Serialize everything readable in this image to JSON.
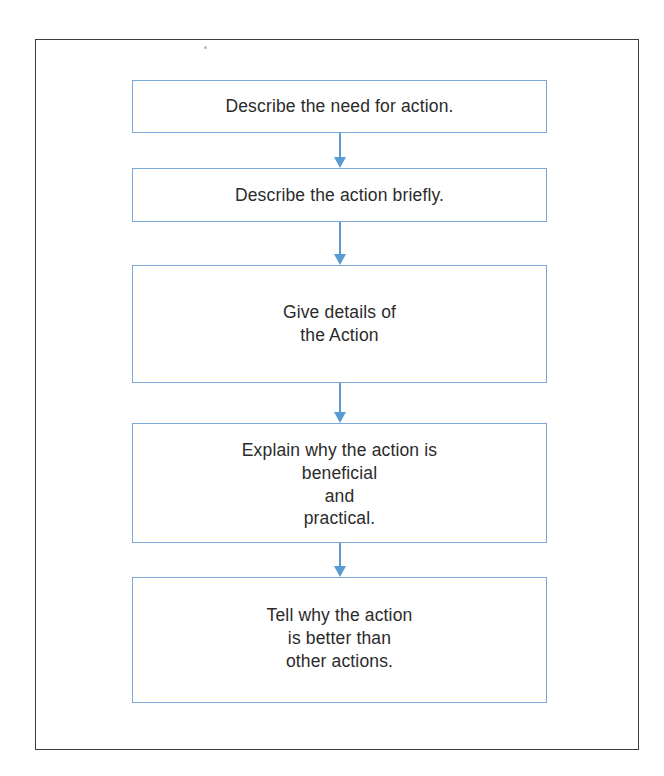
{
  "page": {
    "background_color": "#ffffff",
    "frame_border_color": "#3d3d3d",
    "box_border_color": "#7ba7d7",
    "arrow_color": "#5b9bd5",
    "text_color": "#2b2b2b"
  },
  "diagram": {
    "type": "flowchart",
    "orientation": "vertical-top-to-bottom",
    "node_count": 5,
    "connector_count": 4,
    "nodes": [
      {
        "id": "step-1",
        "text": "Describe the need for action.",
        "lines": [
          "Describe the need for action."
        ],
        "align": "center"
      },
      {
        "id": "step-2",
        "text": "Describe the action briefly.",
        "lines": [
          "Describe the action briefly."
        ],
        "align": "center"
      },
      {
        "id": "step-3",
        "text": "Give details of\nthe Action",
        "lines": [
          "Give details of",
          "the Action"
        ],
        "align": "center"
      },
      {
        "id": "step-4",
        "text": "Explain why the action is\nbeneficial\nand\npractical.",
        "lines": [
          "Explain why the action is",
          "beneficial",
          "and",
          "practical."
        ],
        "align": "top"
      },
      {
        "id": "step-5",
        "text": "Tell why the action\nis better than\nother actions.",
        "lines": [
          "Tell why the action",
          "is better than",
          "other actions."
        ],
        "align": "top"
      }
    ],
    "connectors": [
      {
        "id": "arrow-1",
        "from": "step-1",
        "to": "step-2",
        "icon": "arrow-down-icon"
      },
      {
        "id": "arrow-2",
        "from": "step-2",
        "to": "step-3",
        "icon": "arrow-down-icon"
      },
      {
        "id": "arrow-3",
        "from": "step-3",
        "to": "step-4",
        "icon": "arrow-down-icon"
      },
      {
        "id": "arrow-4",
        "from": "step-4",
        "to": "step-5",
        "icon": "arrow-down-icon"
      }
    ]
  }
}
